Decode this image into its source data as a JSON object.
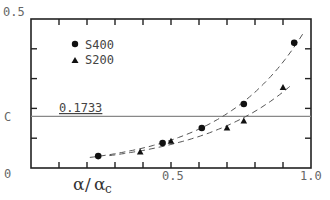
{
  "chart_data": {
    "type": "scatter",
    "title": "",
    "xlabel": "α/α_c",
    "ylabel": "",
    "xlim": [
      0,
      1.0
    ],
    "ylim": [
      0,
      0.5
    ],
    "x_ticks": [
      0,
      0.1,
      0.2,
      0.3,
      0.4,
      0.5,
      0.6,
      0.7,
      0.8,
      0.9,
      1.0
    ],
    "x_tick_labels": [
      {
        "value": 0.5,
        "label": "0.5"
      },
      {
        "value": 1.0,
        "label": "1.0"
      }
    ],
    "y_ticks": [
      0,
      0.1,
      0.2,
      0.3,
      0.4,
      0.5
    ],
    "y_tick_labels": [
      {
        "value": 0.5,
        "label": "0.5"
      },
      {
        "value": 0.1733,
        "label": "C"
      },
      {
        "value": 0,
        "label": "0"
      }
    ],
    "grid": false,
    "legend_position": "upper-left",
    "reference_line": {
      "y": 0.1733,
      "label": "0.1733"
    },
    "series": [
      {
        "name": "S400",
        "marker": "circle",
        "points": [
          [
            0.24,
            0.04
          ],
          [
            0.47,
            0.084
          ],
          [
            0.61,
            0.134
          ],
          [
            0.76,
            0.215
          ],
          [
            0.94,
            0.42
          ]
        ],
        "fit_curve": "dashed"
      },
      {
        "name": "S200",
        "marker": "triangle",
        "points": [
          [
            0.39,
            0.054
          ],
          [
            0.5,
            0.09
          ],
          [
            0.7,
            0.134
          ],
          [
            0.76,
            0.158
          ],
          [
            0.9,
            0.27
          ]
        ],
        "fit_curve": "dashed"
      }
    ]
  },
  "labels": {
    "y_top": "0.5",
    "y_c": "C",
    "y_zero": "0",
    "x_mid": "0.5",
    "x_end": "1.0",
    "ref_value": "0.1733",
    "xlabel_main1": "α",
    "xlabel_slash": "/",
    "xlabel_main2": "α",
    "xlabel_sub": "c",
    "legend_s400": "S400",
    "legend_s200": "S200"
  }
}
